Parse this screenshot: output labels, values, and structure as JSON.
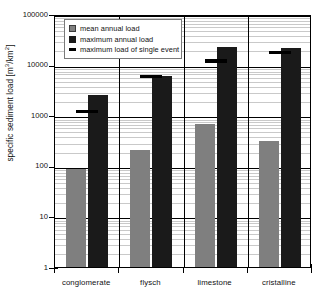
{
  "chart_data": {
    "type": "bar",
    "title": "",
    "xlabel": "",
    "ylabel": "specific sediment load [m³/km²]",
    "ylabel_base": "specific sediment load [m",
    "ylabel_sup1": "3",
    "ylabel_mid": "/km",
    "ylabel_sup2": "2",
    "ylabel_end": "]",
    "yscale": "log",
    "ylim": [
      1,
      100000
    ],
    "ytick_labels": [
      "100000",
      "10000",
      "1000",
      "100",
      "10",
      "1"
    ],
    "ytick_values": [
      100000,
      10000,
      1000,
      100,
      10,
      1
    ],
    "grid": "major horizontal lines plus log minor lines",
    "legend_position": "upper-left inside plot",
    "categories": [
      "conglomerate",
      "flysch",
      "limestone",
      "cristalline"
    ],
    "series": [
      {
        "name": "mean annual load",
        "type": "bar",
        "color": "#7f7f7f",
        "values": [
          85,
          210,
          670,
          310
        ]
      },
      {
        "name": "maximum annual load",
        "type": "bar",
        "color": "#1a1a1a",
        "values": [
          2500,
          6000,
          22000,
          21000
        ]
      },
      {
        "name": "maximum load of single event",
        "type": "marker",
        "color": "#000000",
        "values": [
          1300,
          6300,
          13000,
          19000
        ]
      }
    ]
  },
  "legend": {
    "items": [
      {
        "label": "mean annual load",
        "swatch": "square-gray-icon"
      },
      {
        "label": "maximum annual load",
        "swatch": "square-black-icon"
      },
      {
        "label": "maximum load of single event",
        "swatch": "dash-black-icon"
      }
    ]
  },
  "colors": {
    "mean_annual_load": "#7f7f7f",
    "maximum_annual_load": "#1a1a1a",
    "single_event_marker": "#000000",
    "axis": "#000000",
    "minor_grid": "#c9c9c9",
    "background": "#ffffff"
  }
}
